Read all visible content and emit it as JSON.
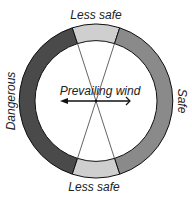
{
  "diagram": {
    "labels": {
      "top": "Less safe",
      "bottom": "Less safe",
      "left": "Dangerous",
      "right": "Safe",
      "center": "Prevailing wind"
    },
    "colors": {
      "dangerous": "#4a4a4a",
      "safe": "#8a8a8a",
      "less_safe": "#cfcfcf",
      "outline": "#111111"
    }
  }
}
